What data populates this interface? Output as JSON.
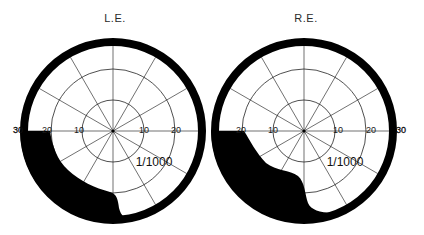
{
  "figure": {
    "width": 424,
    "height": 235,
    "colors": {
      "background": "#ffffff",
      "ink": "#000000",
      "grid": "#333333"
    }
  },
  "fields": [
    {
      "id": "left-eye",
      "label": "L.E.",
      "center": [
        113,
        131
      ],
      "outer_radius": 93,
      "inner_radius": 85,
      "ring_radii": [
        31,
        62
      ],
      "spoke_angles_deg": [
        0,
        30,
        60,
        90,
        120,
        150
      ],
      "tick_labels": [
        {
          "text": "30",
          "x": 18,
          "y": 133
        },
        {
          "text": "20",
          "x": 47,
          "y": 133
        },
        {
          "text": "10",
          "x": 79,
          "y": 133
        },
        {
          "text": "10",
          "x": 144,
          "y": 133
        },
        {
          "text": "20",
          "x": 176,
          "y": 133
        }
      ],
      "isopter_label": {
        "text": "1/1000",
        "x": 154,
        "y": 166
      },
      "scotoma_path": "M 20 131 L 50 131 C 52 145, 57 160, 68 170 C 80 181, 95 188, 110 192 C 117 194, 118 200, 119 208 C 121 216, 125 219, 132 221 A 93 93 0 0 1 20 131 Z"
    },
    {
      "id": "right-eye",
      "label": "R.E.",
      "center": [
        304,
        131
      ],
      "outer_radius": 93,
      "inner_radius": 85,
      "ring_radii": [
        31,
        62
      ],
      "spoke_angles_deg": [
        0,
        30,
        60,
        90,
        120,
        150
      ],
      "tick_labels": [
        {
          "text": "20",
          "x": 241,
          "y": 133
        },
        {
          "text": "10",
          "x": 273,
          "y": 133
        },
        {
          "text": "10",
          "x": 338,
          "y": 133
        },
        {
          "text": "20",
          "x": 371,
          "y": 133
        },
        {
          "text": "30",
          "x": 401,
          "y": 133
        }
      ],
      "isopter_label": {
        "text": "1/1000",
        "x": 345,
        "y": 166
      },
      "scotoma_path": "M 211 131 L 244 131 C 250 140, 256 153, 266 163 C 276 171, 290 170, 298 176 C 305 182, 305 195, 308 203 C 312 212, 325 214, 346 212 A 93 93 0 0 1 211 131 Z"
    }
  ]
}
